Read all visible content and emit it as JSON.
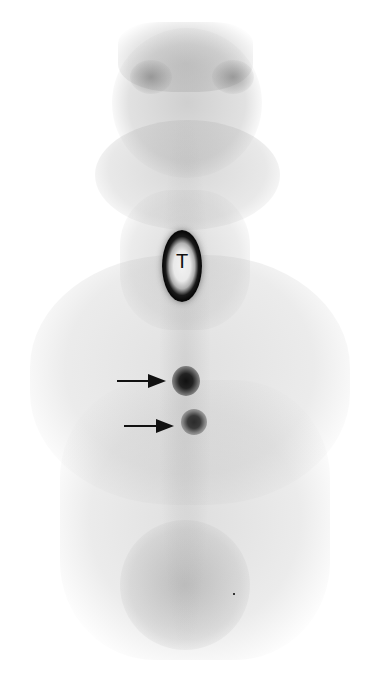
{
  "image": {
    "type": "scintigraphy",
    "view": "anterior",
    "background_color": "#ffffff",
    "uptake_color": "#111111"
  },
  "labels": {
    "thyroid": "T"
  },
  "annotations": {
    "arrows": [
      {
        "name": "arrow-upper-focus",
        "direction": "right",
        "target": "upper focal uptake"
      },
      {
        "name": "arrow-lower-focus",
        "direction": "right",
        "target": "lower focal uptake"
      }
    ]
  }
}
